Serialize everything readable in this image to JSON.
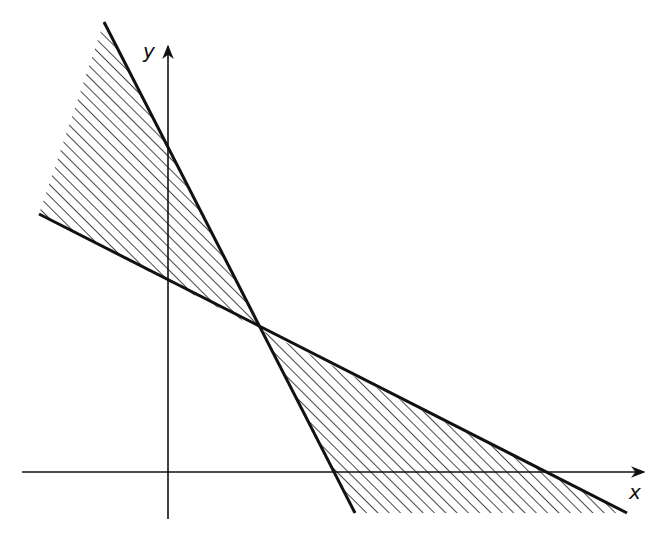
{
  "diagram": {
    "type": "linear-inequality-region",
    "axes": {
      "x_label": "x",
      "y_label": "y",
      "origin_px": [
        168,
        472
      ],
      "x_axis": {
        "start": [
          22,
          472
        ],
        "end": [
          644,
          472
        ]
      },
      "y_axis": {
        "start": [
          168,
          519
        ],
        "end": [
          168,
          46
        ]
      }
    },
    "lines": [
      {
        "name": "steep-line",
        "from": [
          104,
          22
        ],
        "to": [
          355,
          513
        ],
        "y_intercept_px": [
          168,
          145
        ],
        "x_intercept_px": [
          334,
          472
        ]
      },
      {
        "name": "shallow-line",
        "from": [
          39,
          214
        ],
        "to": [
          627,
          513
        ],
        "y_intercept_px": [
          168,
          279
        ],
        "x_intercept_px": [
          549,
          472
        ]
      }
    ],
    "intersection_px": [
      261,
      330
    ],
    "shaded_regions": [
      {
        "name": "upper-left-region",
        "points": [
          [
            104,
            22
          ],
          [
            261,
            330
          ],
          [
            39,
            214
          ]
        ]
      },
      {
        "name": "lower-right-region",
        "points": [
          [
            261,
            330
          ],
          [
            627,
            513
          ],
          [
            355,
            513
          ]
        ]
      }
    ],
    "hatch": {
      "angle_deg": 45,
      "spacing_px": 8,
      "color": "#1a1a1a"
    },
    "colors": {
      "line": "#111111",
      "background": "#ffffff"
    }
  }
}
